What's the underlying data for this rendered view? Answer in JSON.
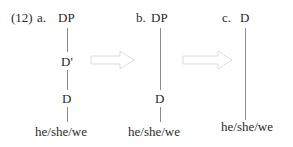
{
  "example": {
    "number": "(12)",
    "trees": [
      {
        "label": "a.",
        "nodes": [
          "DP",
          "D'",
          "D",
          "he/she/we"
        ]
      },
      {
        "label": "b.",
        "nodes": [
          "DP",
          "D",
          "he/she/we"
        ]
      },
      {
        "label": "c.",
        "nodes": [
          "D",
          "he/she/we"
        ]
      }
    ],
    "arrows": [
      {
        "from": "a",
        "to": "b",
        "icon": "right-arrow-icon"
      },
      {
        "from": "b",
        "to": "c",
        "icon": "right-arrow-icon"
      }
    ],
    "colors": {
      "text": "#2a2a2a",
      "line": "#8a8a8a",
      "arrow": "#dcdcdc"
    }
  }
}
